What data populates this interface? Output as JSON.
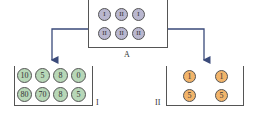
{
  "containers": {
    "A": {
      "label": "A",
      "balls": [
        "I",
        "II",
        "I",
        "II",
        "II",
        "II"
      ]
    },
    "I": {
      "label": "I",
      "balls": [
        "10",
        "5",
        "8",
        "0",
        "80",
        "70",
        "8",
        "5"
      ]
    },
    "II": {
      "label": "II",
      "balls": [
        "1",
        "1",
        "5",
        "5"
      ]
    }
  },
  "colors": {
    "A_ball": "#b9b7cf",
    "I_ball": "#b7d7b7",
    "II_ball": "#f2b46a",
    "line": "#3a4a7a"
  }
}
